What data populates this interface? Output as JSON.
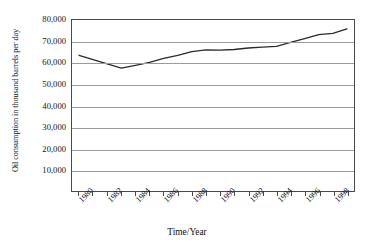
{
  "chart_data": {
    "type": "line",
    "title": "",
    "xlabel": "Time/Year",
    "ylabel": "Oil consumption in thousand barrels per day",
    "x": [
      1980,
      1981,
      1982,
      1983,
      1984,
      1985,
      1986,
      1987,
      1988,
      1989,
      1990,
      1991,
      1992,
      1993,
      1994,
      1995,
      1996,
      1997,
      1998,
      1999
    ],
    "values": [
      63500,
      61500,
      59500,
      57500,
      58800,
      60200,
      62000,
      63500,
      65200,
      66000,
      65900,
      66200,
      66900,
      67300,
      67700,
      69500,
      71300,
      73200,
      73700,
      75800
    ],
    "series": [
      {
        "name": "Oil consumption",
        "values": [
          63500,
          61500,
          59500,
          57500,
          58800,
          60200,
          62000,
          63500,
          65200,
          66000,
          65900,
          66200,
          66900,
          67300,
          67700,
          69500,
          71300,
          73200,
          73700,
          75800
        ]
      }
    ],
    "ylim": [
      0,
      80000
    ],
    "xlim": [
      1979.5,
      1999.5
    ],
    "yticks": [
      0,
      10000,
      20000,
      30000,
      40000,
      50000,
      60000,
      70000,
      80000
    ],
    "ytick_labels": [
      "",
      "10,000",
      "20,000",
      "30,000",
      "40,000",
      "50,000",
      "60,000",
      "70,000",
      "80,000"
    ],
    "xticks": [
      1980,
      1981,
      1982,
      1983,
      1984,
      1985,
      1986,
      1987,
      1988,
      1989,
      1990,
      1991,
      1992,
      1993,
      1994,
      1995,
      1996,
      1997,
      1998,
      1999
    ],
    "xtick_labels": [
      "1980",
      "",
      "1982",
      "",
      "1984",
      "",
      "1986",
      "",
      "1988",
      "",
      "1990",
      "",
      "1992",
      "",
      "1994",
      "",
      "1996",
      "",
      "1998",
      ""
    ],
    "grid": "horizontal",
    "legend": "none",
    "line_color": "#2b2b2b",
    "grid_color": "#9b9b9b",
    "axis_color": "#4a4a4a"
  }
}
